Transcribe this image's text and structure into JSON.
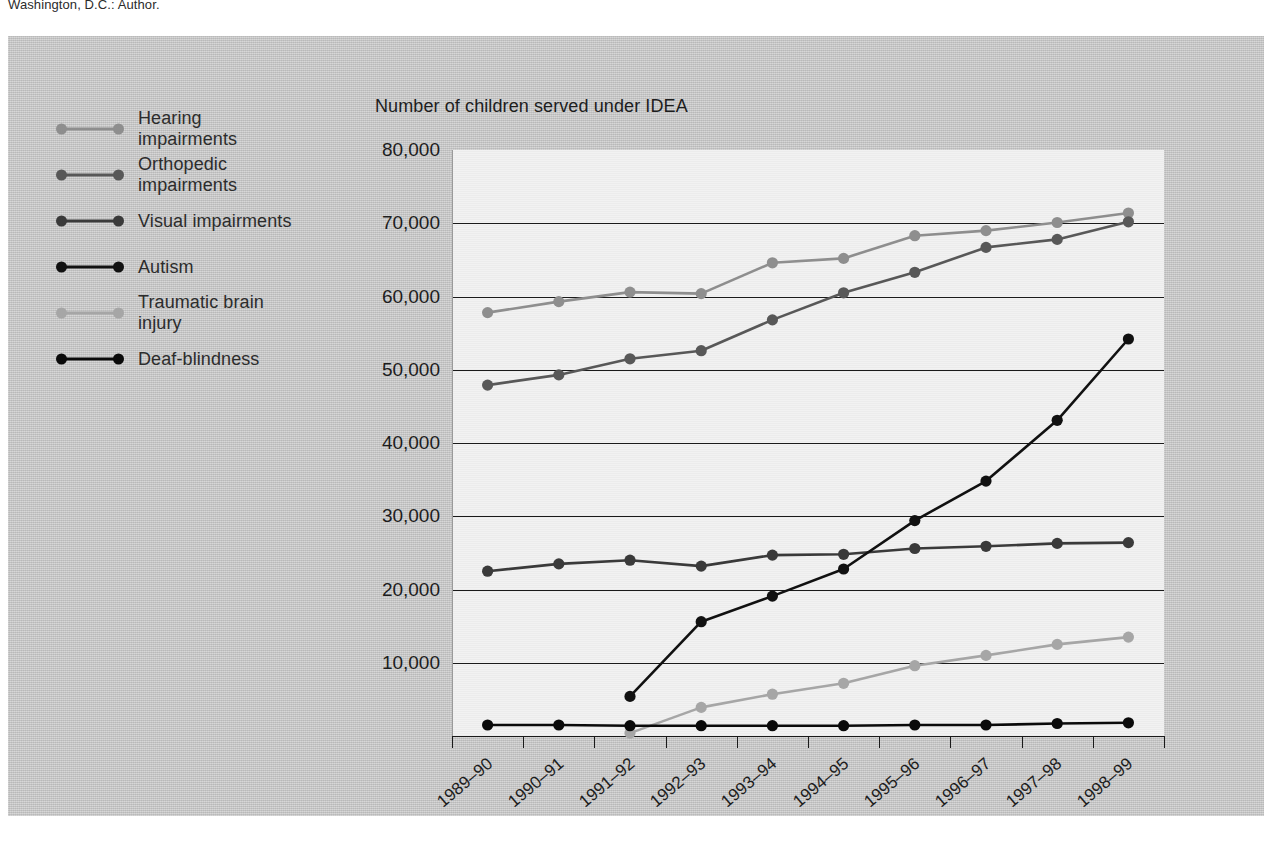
{
  "page": {
    "header_text": "Washington, D.C.: Author."
  },
  "legend": {
    "items": [
      {
        "label": "Hearing\nimpairments",
        "color": "#8e8e8e",
        "key": "hearing"
      },
      {
        "label": "Orthopedic\nimpairments",
        "color": "#585858",
        "key": "orthopedic"
      },
      {
        "label": "Visual impairments",
        "color": "#3a3a3a",
        "key": "visual"
      },
      {
        "label": "Autism",
        "color": "#111111",
        "key": "autism"
      },
      {
        "label": "Traumatic brain\ninjury",
        "color": "#a6a6a6",
        "key": "tbi"
      },
      {
        "label": "Deaf-blindness",
        "color": "#0a0a0a",
        "key": "deafblind"
      }
    ]
  },
  "chart_data": {
    "type": "line",
    "title": "Number of children served under IDEA",
    "xlabel": "Years",
    "ylabel": "",
    "ylim": [
      0,
      80000
    ],
    "ytick_values": [
      10000,
      20000,
      30000,
      40000,
      50000,
      60000,
      70000,
      80000
    ],
    "ytick_labels": [
      "10,000",
      "20,000",
      "30,000",
      "40,000",
      "50,000",
      "60,000",
      "70,000",
      "80,000"
    ],
    "gridlines_drawn": [
      10000,
      20000,
      30000,
      40000,
      50000,
      60000,
      70000
    ],
    "grid": true,
    "legend_position": "left-outside",
    "categories": [
      "1989–90",
      "1990–91",
      "1991–92",
      "1992–93",
      "1993–94",
      "1994–95",
      "1995–96",
      "1996–97",
      "1997–98",
      "1998–99"
    ],
    "series": [
      {
        "name": "Hearing impairments",
        "color": "#8e8e8e",
        "values": [
          57800,
          59300,
          60600,
          60400,
          64600,
          65200,
          68300,
          69000,
          70100,
          71400
        ]
      },
      {
        "name": "Orthopedic impairments",
        "color": "#585858",
        "values": [
          47900,
          49300,
          51500,
          52600,
          56800,
          60500,
          63300,
          66700,
          67800,
          70200
        ]
      },
      {
        "name": "Visual impairments",
        "color": "#3a3a3a",
        "values": [
          22500,
          23500,
          24000,
          23200,
          24700,
          24800,
          25600,
          25900,
          26300,
          26400
        ]
      },
      {
        "name": "Autism",
        "color": "#111111",
        "values": [
          null,
          null,
          5400,
          15600,
          19100,
          22800,
          29400,
          34800,
          43100,
          54200
        ]
      },
      {
        "name": "Traumatic brain injury",
        "color": "#a6a6a6",
        "values": [
          null,
          null,
          400,
          3900,
          5700,
          7200,
          9600,
          11000,
          12500,
          13500
        ]
      },
      {
        "name": "Deaf-blindness",
        "color": "#0a0a0a",
        "values": [
          1500,
          1500,
          1400,
          1400,
          1400,
          1400,
          1500,
          1500,
          1700,
          1800
        ]
      }
    ]
  }
}
